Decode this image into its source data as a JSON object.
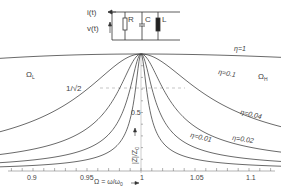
{
  "circuit": {
    "current_label": "i(t)",
    "voltage_label": "v(t)",
    "components": [
      "R",
      "C",
      "L"
    ]
  },
  "chart_data": {
    "type": "line",
    "title": "",
    "xlabel": "Ω = ω/ω₀",
    "ylabel": "|Z|/Z₀",
    "xlim": [
      0.875,
      1.125
    ],
    "ylim": [
      0,
      1
    ],
    "x_ticks": [
      "0.9",
      "0.95",
      "1",
      "1.05",
      "1.1"
    ],
    "y_ticks": [
      "0.5"
    ],
    "reference_line": {
      "label": "1/√2",
      "value": 0.707
    },
    "series": [
      {
        "name": "η=1",
        "eta": 1
      },
      {
        "name": "η=0.1",
        "eta": 0.1
      },
      {
        "name": "η=0.04",
        "eta": 0.04
      },
      {
        "name": "η=0.02",
        "eta": 0.02
      },
      {
        "name": "η=0.01",
        "eta": 0.01
      }
    ],
    "annotations": [
      "Ω_L",
      "Ω_H"
    ],
    "grid": false
  },
  "labels": {
    "eta1": "η=1",
    "eta01": "η=0.1",
    "eta004": "η=0.04",
    "eta002": "η=0.02",
    "eta001": "η=0.01",
    "omega_l": "Ω",
    "omega_l_sub": "L",
    "omega_h": "Ω",
    "omega_h_sub": "H",
    "inv_sqrt2": "1/√2",
    "y_half": "0.5",
    "ylabel": "|Z|/Z",
    "ylabel_sub": "0",
    "xlabel": "Ω = ω/ω",
    "xlabel_sub": "0",
    "x_ticks": [
      "0.9",
      "0.95",
      "1",
      "1.05",
      "1.1"
    ]
  }
}
